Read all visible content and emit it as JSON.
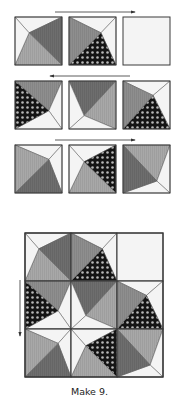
{
  "caption": "Make 9.",
  "colors": {
    "white": "#f4f4f4",
    "light": "#a8a8a8",
    "medium": "#8e8e8e",
    "dark": "#6e6e6e",
    "dotted_bg": "#141414",
    "dot": "#b8b8b8",
    "outline": "#3a3a3a",
    "arrow": "#333333"
  },
  "block_templates": {
    "r1c1": {
      "p": [
        0.3,
        0.33
      ],
      "top": "white",
      "left": "white",
      "bottom": "light",
      "right": "dark"
    },
    "r1c2": {
      "p": [
        0.68,
        0.33
      ],
      "top": "white",
      "left": "medium",
      "bottom": "dotted",
      "right": "white"
    },
    "r1c3": {
      "plain": true,
      "fill": "white"
    },
    "r2c1": {
      "p": [
        0.72,
        0.62
      ],
      "top": "medium",
      "left": "dotted",
      "bottom": "white",
      "right": "white"
    },
    "r2c2": {
      "p": [
        0.32,
        0.72
      ],
      "top": "dark",
      "left": "white",
      "bottom": "white",
      "right": "light"
    },
    "r2c3": {
      "p": [
        0.64,
        0.3
      ],
      "top": "white",
      "left": "medium",
      "bottom": "dotted",
      "right": "white"
    },
    "r3c1": {
      "p": [
        0.72,
        0.3
      ],
      "top": "white",
      "left": "light",
      "bottom": "dark",
      "right": "white"
    },
    "r3c2": {
      "p": [
        0.32,
        0.35
      ],
      "top": "white",
      "left": "white",
      "bottom": "light",
      "right": "dotted"
    },
    "r3c3": {
      "p": [
        0.72,
        0.75
      ],
      "top": "light",
      "left": "dark",
      "bottom": "white",
      "right": "white"
    }
  },
  "rows": [
    {
      "y": 17,
      "blocks": [
        "r1c1",
        "r1c2",
        "r1c3"
      ]
    },
    {
      "y": 81,
      "blocks": [
        "r2c1",
        "r2c2",
        "r2c3"
      ]
    },
    {
      "y": 145,
      "blocks": [
        "r3c1",
        "r3c2",
        "r3c3"
      ]
    }
  ],
  "row_block_x": [
    15,
    69,
    123
  ],
  "row_block_size": [
    47,
    48
  ],
  "arrows": [
    {
      "name": "row1-press-right-arrow",
      "x1": 55,
      "y1": 12,
      "x2": 135,
      "y2": 12,
      "direction": "right"
    },
    {
      "name": "row2-press-left-arrow",
      "x1": 130,
      "y1": 76,
      "x2": 50,
      "y2": 76,
      "direction": "left"
    },
    {
      "name": "row3-press-right-arrow",
      "x1": 55,
      "y1": 140,
      "x2": 135,
      "y2": 140,
      "direction": "right"
    },
    {
      "name": "assembled-press-down-arrow",
      "x1": 20,
      "y1": 280,
      "x2": 20,
      "y2": 336,
      "direction": "down"
    }
  ],
  "assembled": {
    "x": 25,
    "y": 233,
    "cell_w": 46,
    "cell_h": 48,
    "grid": [
      [
        "r1c1",
        "r1c2",
        "r1c3"
      ],
      [
        "r2c1",
        "r2c2",
        "r2c3"
      ],
      [
        "r3c1",
        "r3c2",
        "r3c3"
      ]
    ]
  }
}
